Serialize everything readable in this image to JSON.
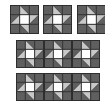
{
  "colors": {
    "background": "#ffffff",
    "dark": "#5f5f5f",
    "light": "#c8c8c8",
    "center": "#ffffff",
    "grid": "#2e2e2e"
  },
  "block_pattern": {
    "grid": 3,
    "cells": [
      [
        "dark",
        "tri-bl",
        "dark"
      ],
      [
        "tri-br",
        "center",
        "tri-tl"
      ],
      [
        "dark",
        "tri-tr",
        "dark"
      ]
    ]
  },
  "rows": [
    {
      "name": "row-1-separate-blocks",
      "blocks": [
        {
          "x": 10,
          "y": 5,
          "w": 29,
          "h": 29
        },
        {
          "x": 43,
          "y": 5,
          "w": 29,
          "h": 29
        },
        {
          "x": 77,
          "y": 5,
          "w": 29,
          "h": 29
        }
      ]
    },
    {
      "name": "row-2-joined-strip",
      "blocks": [
        {
          "x": 16,
          "y": 40,
          "w": 28,
          "h": 28
        },
        {
          "x": 44,
          "y": 40,
          "w": 28,
          "h": 28
        },
        {
          "x": 72,
          "y": 40,
          "w": 28,
          "h": 28
        }
      ]
    },
    {
      "name": "row-3-joined-strip",
      "blocks": [
        {
          "x": 16,
          "y": 73,
          "w": 28,
          "h": 28
        },
        {
          "x": 44,
          "y": 73,
          "w": 28,
          "h": 28
        },
        {
          "x": 72,
          "y": 73,
          "w": 28,
          "h": 28
        }
      ]
    }
  ]
}
